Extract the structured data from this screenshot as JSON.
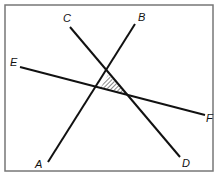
{
  "diagram": {
    "type": "intersecting-lines",
    "frame": {
      "x": 5,
      "y": 5,
      "width": 208,
      "height": 166,
      "stroke": "#777777"
    },
    "line_color": "#111111",
    "lines": [
      {
        "name": "AB",
        "from": {
          "label": "A",
          "x": 48,
          "y": 162
        },
        "to": {
          "label": "B",
          "x": 135,
          "y": 24
        }
      },
      {
        "name": "CD",
        "from": {
          "label": "C",
          "x": 70,
          "y": 27
        },
        "to": {
          "label": "D",
          "x": 180,
          "y": 157
        }
      },
      {
        "name": "EF",
        "from": {
          "label": "E",
          "x": 20,
          "y": 67
        },
        "to": {
          "label": "F",
          "x": 205,
          "y": 115
        }
      }
    ],
    "labels": {
      "A": {
        "text": "A",
        "x": 35,
        "y": 168
      },
      "B": {
        "text": "B",
        "x": 138,
        "y": 21
      },
      "C": {
        "text": "C",
        "x": 63,
        "y": 22
      },
      "D": {
        "text": "D",
        "x": 182,
        "y": 167
      },
      "E": {
        "text": "E",
        "x": 10,
        "y": 66
      },
      "F": {
        "text": "F",
        "x": 206,
        "y": 122
      }
    },
    "shaded_region": {
      "description": "triangle formed by the three intersecting lines, hatched",
      "points": "108,75 127,94 101,87"
    }
  }
}
